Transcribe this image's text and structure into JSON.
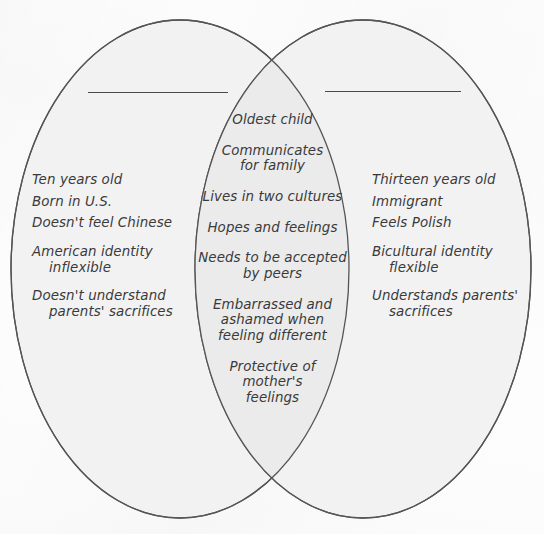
{
  "diagram": {
    "type": "venn-diagram",
    "kind": "two-circle-venn",
    "background_color": "#fdfdfd",
    "ellipse_fill_color": "#f2f2f2",
    "ellipse_overlap_fill_color": "#ececec",
    "ellipse_stroke_color": "#555555",
    "text_color": "#3a3a3a"
  },
  "left_circle": {
    "title_label": "",
    "title_rule_present": true,
    "items": [
      {
        "line1": "Ten years old",
        "line2": "",
        "gap_before": false
      },
      {
        "line1": "Born in U.S.",
        "line2": "",
        "gap_before": false
      },
      {
        "line1": "Doesn't feel Chinese",
        "line2": "",
        "gap_before": false
      },
      {
        "line1": "American identity",
        "line2": "inflexible",
        "gap_before": true
      },
      {
        "line1": "Doesn't understand",
        "line2": "parents' sacrifices",
        "gap_before": true
      }
    ]
  },
  "center_overlap": {
    "items": [
      {
        "line1": "Oldest child",
        "line2": "",
        "line3": ""
      },
      {
        "line1": "Communicates",
        "line2": "for family",
        "line3": ""
      },
      {
        "line1": "Lives in two cultures",
        "line2": "",
        "line3": ""
      },
      {
        "line1": "Hopes and feelings",
        "line2": "",
        "line3": ""
      },
      {
        "line1": "Needs to be accepted",
        "line2": "by peers",
        "line3": ""
      },
      {
        "line1": "Embarrassed and",
        "line2": "ashamed when",
        "line3": "feeling different"
      },
      {
        "line1": "Protective of",
        "line2": "mother's",
        "line3": "feelings"
      }
    ]
  },
  "right_circle": {
    "title_label": "",
    "title_rule_present": true,
    "items": [
      {
        "line1": "Thirteen years old",
        "line2": "",
        "gap_before": false
      },
      {
        "line1": "Immigrant",
        "line2": "",
        "gap_before": false
      },
      {
        "line1": "Feels Polish",
        "line2": "",
        "gap_before": false
      },
      {
        "line1": "Bicultural identity",
        "line2": "flexible",
        "gap_before": true
      },
      {
        "line1": "Understands parents'",
        "line2": "sacrifices",
        "gap_before": true
      }
    ]
  }
}
